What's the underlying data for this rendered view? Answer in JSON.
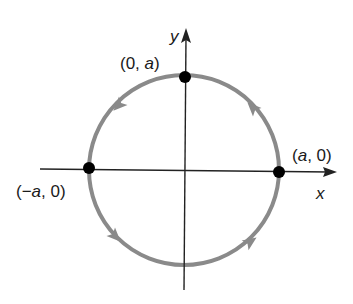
{
  "diagram": {
    "type": "circle-parametric-orientation",
    "center": [
      184,
      170
    ],
    "radius": 95,
    "colors": {
      "circle": "#8a8a8a",
      "axes": "#222222",
      "points": "#000000",
      "text": "#1a1a1a"
    },
    "axes": {
      "x_label": "x",
      "y_label": "y"
    },
    "points": [
      {
        "name": "top",
        "label_open": "(0, ",
        "label_var": "a",
        "label_close": ")"
      },
      {
        "name": "right",
        "label_open": "(",
        "label_var": "a",
        "label_close": ", 0)"
      },
      {
        "name": "left",
        "label_open": "(−",
        "label_var": "a",
        "label_close": ", 0)"
      }
    ],
    "orientation": "counterclockwise"
  }
}
